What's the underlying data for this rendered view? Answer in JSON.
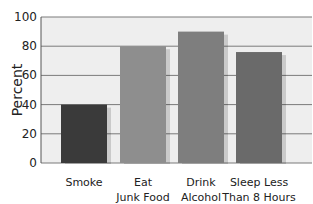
{
  "chart_data": {
    "type": "bar",
    "title": "",
    "xlabel": "",
    "ylabel": "Percent",
    "ylim": [
      0,
      100
    ],
    "yticks": [
      0,
      20,
      40,
      60,
      80,
      100
    ],
    "grid": true,
    "legend": null,
    "categories": [
      [
        "Smoke"
      ],
      [
        "Eat",
        "Junk Food"
      ],
      [
        "Drink",
        "Alcohol"
      ],
      [
        "Sleep Less",
        "Than 8 Hours"
      ]
    ],
    "category_labels": [
      "Smoke",
      "Eat Junk Food",
      "Drink Alcohol",
      "Sleep Less Than 8 Hours"
    ],
    "values": [
      40,
      80,
      90,
      76
    ],
    "colors": [
      "#3a3a3a",
      "#8e8e8e",
      "#7e7e7e",
      "#6a6a6a"
    ]
  },
  "style": {
    "plot_bg": "#eeeeee",
    "grid_color": "#7a7a7a",
    "axis_color": "#555555"
  }
}
